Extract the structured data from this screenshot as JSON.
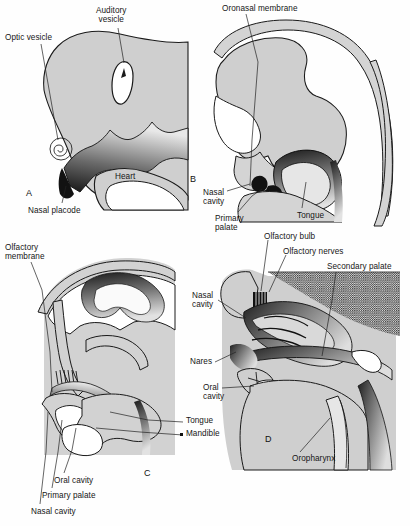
{
  "figure": {
    "background_color": "#fefefe",
    "tissue_fill": "#cfcfcf",
    "tissue_fill_light": "#dcdcdc",
    "outline_color": "#1a1a1a",
    "stipple_color": "#3a3a3a",
    "label_color": "#161616",
    "leader_color": "#222222"
  },
  "panels": [
    {
      "id": "A",
      "letter": "A",
      "letter_pos": {
        "x": 26,
        "y": 188
      },
      "caption": "Early embryo: optic vesicle, auditory vesicle, nasal placode and heart",
      "labels": [
        {
          "name": "optic-vesicle",
          "text": "Optic vesicle",
          "x": 5,
          "y": 33,
          "align": "left"
        },
        {
          "name": "auditory-vesicle",
          "text": "Auditory\nvesicle",
          "x": 96,
          "y": 6,
          "align": "left"
        },
        {
          "name": "heart",
          "text": "Heart",
          "x": 115,
          "y": 172,
          "align": "left"
        },
        {
          "name": "nasal-placode",
          "text": "Nasal placode",
          "x": 28,
          "y": 206,
          "align": "left"
        }
      ]
    },
    {
      "id": "B",
      "letter": "B",
      "letter_pos": {
        "x": 190,
        "y": 174
      },
      "caption": "Oronasal membrane stage with primary palate and tongue",
      "labels": [
        {
          "name": "oronasal-membrane",
          "text": "Oronasal membrane",
          "x": 222,
          "y": 4,
          "align": "left"
        },
        {
          "name": "nasal-cavity",
          "text": "Nasal\ncavity",
          "x": 203,
          "y": 188,
          "align": "left"
        },
        {
          "name": "primary-palate",
          "text": "Primary\npalate",
          "x": 215,
          "y": 214,
          "align": "left"
        },
        {
          "name": "tongue",
          "text": "Tongue",
          "x": 297,
          "y": 211,
          "align": "left"
        }
      ]
    },
    {
      "id": "C",
      "letter": "C",
      "letter_pos": {
        "x": 144,
        "y": 472
      },
      "caption": "Olfactory membrane, oral and nasal cavities separated by primary palate",
      "labels": [
        {
          "name": "olfactory-membrane",
          "text": "Olfactory\nmembrane",
          "x": 5,
          "y": 243,
          "align": "left"
        },
        {
          "name": "tongue",
          "text": "Tongue",
          "x": 186,
          "y": 420,
          "align": "left"
        },
        {
          "name": "mandible",
          "text": "Mandible",
          "x": 186,
          "y": 433,
          "align": "left"
        },
        {
          "name": "oral-cavity",
          "text": "Oral cavity",
          "x": 54,
          "y": 476,
          "align": "left"
        },
        {
          "name": "primary-palate",
          "text": "Primary palate",
          "x": 42,
          "y": 491,
          "align": "left"
        },
        {
          "name": "nasal-cavity",
          "text": "Nasal cavity",
          "x": 31,
          "y": 507,
          "align": "left"
        }
      ]
    },
    {
      "id": "D",
      "letter": "D",
      "letter_pos": {
        "x": 265,
        "y": 437
      },
      "caption": "Mature fetal head: olfactory bulb, nerves, secondary palate and oropharynx",
      "labels": [
        {
          "name": "olfactory-bulb",
          "text": "Olfactory bulb",
          "x": 264,
          "y": 232,
          "align": "left"
        },
        {
          "name": "olfactory-nerves",
          "text": "Olfactory nerves",
          "x": 283,
          "y": 247,
          "align": "left"
        },
        {
          "name": "secondary-palate",
          "text": "Secondary palate",
          "x": 327,
          "y": 263,
          "align": "left"
        },
        {
          "name": "nasal-cavity",
          "text": "Nasal\ncavity",
          "x": 192,
          "y": 291,
          "align": "left"
        },
        {
          "name": "nares",
          "text": "Nares",
          "x": 190,
          "y": 360,
          "align": "left"
        },
        {
          "name": "oral-cavity",
          "text": "Oral\ncavity",
          "x": 203,
          "y": 384,
          "align": "left"
        },
        {
          "name": "oropharynx",
          "text": "Oropharynx",
          "x": 292,
          "y": 456,
          "align": "left"
        }
      ]
    }
  ]
}
